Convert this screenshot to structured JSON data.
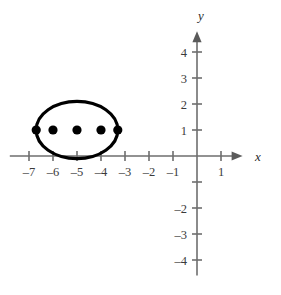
{
  "figure": {
    "title": "",
    "background_color": "#ffffff",
    "curve_color": "#000000",
    "axis_color": "#6e6e6e",
    "point_color": "#000000",
    "label_color": "#3a3a3a"
  },
  "axes": {
    "x_axis_label": "x",
    "y_axis_label": "y",
    "origin_px": {
      "x": 197,
      "y": 156
    },
    "unit_px": {
      "x": 24,
      "y": 26
    },
    "x_range": [
      -7.8,
      1.9
    ],
    "y_range": [
      -4.6,
      4.8
    ],
    "x_ticks": [
      {
        "value": -7,
        "label": "–7"
      },
      {
        "value": -6,
        "label": "–6"
      },
      {
        "value": -5,
        "label": "–5"
      },
      {
        "value": -4,
        "label": "–4"
      },
      {
        "value": -3,
        "label": "–3"
      },
      {
        "value": -2,
        "label": "–2"
      },
      {
        "value": -1,
        "label": "–1"
      },
      {
        "value": 1,
        "label": "1"
      }
    ],
    "y_ticks": [
      {
        "value": 4,
        "label": "4"
      },
      {
        "value": 3,
        "label": "3"
      },
      {
        "value": 2,
        "label": "2"
      },
      {
        "value": 1,
        "label": "1"
      },
      {
        "value": -1,
        "label": ""
      },
      {
        "value": -2,
        "label": "–2"
      },
      {
        "value": -3,
        "label": "–3"
      },
      {
        "value": -4,
        "label": "–4"
      }
    ]
  },
  "chart_data": {
    "type": "scatter",
    "title": "",
    "xlabel": "x",
    "ylabel": "y",
    "xlim": [
      -7.8,
      1.9
    ],
    "ylim": [
      -4.6,
      4.8
    ],
    "grid": false,
    "legend": "none",
    "shapes": [
      {
        "kind": "ellipse",
        "center": [
          -5,
          1
        ],
        "semi_major_x": 1.7,
        "semi_minor_y": 1.1,
        "stroke": "#000000",
        "stroke_width": 3.2,
        "fill": "none"
      }
    ],
    "points": [
      {
        "x": -6.7,
        "y": 1,
        "role": "vertex"
      },
      {
        "x": -6,
        "y": 1,
        "role": "focus"
      },
      {
        "x": -5,
        "y": 1,
        "role": "center"
      },
      {
        "x": -4,
        "y": 1,
        "role": "focus"
      },
      {
        "x": -3.3,
        "y": 1,
        "role": "vertex"
      }
    ]
  }
}
